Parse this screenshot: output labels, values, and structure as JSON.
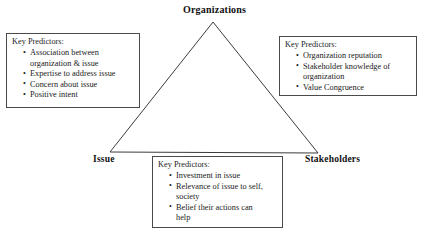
{
  "diagram": {
    "title_label": "Organizations",
    "vertices": [
      {
        "id": "organizations",
        "label": "Organizations"
      },
      {
        "id": "issue",
        "label": "Issue"
      },
      {
        "id": "stakeholders",
        "label": "Stakeholders"
      }
    ],
    "shape": {
      "type": "triangle",
      "stroke_color": "#3b3b3b",
      "apex": [
        213,
        22
      ],
      "bottom_left": [
        110,
        152
      ],
      "bottom_right": [
        318,
        153
      ]
    },
    "boxes": {
      "organizations": {
        "heading": "Key Predictors:",
        "items": [
          {
            "text": "Association between",
            "continuation": "organization & issue"
          },
          {
            "text": "Expertise to address issue",
            "continuation": ""
          },
          {
            "text": "Concern about issue",
            "continuation": ""
          },
          {
            "text": "Positive intent",
            "continuation": ""
          }
        ]
      },
      "stakeholders": {
        "heading": "Key Predictors:",
        "items": [
          {
            "text": "Organization reputation",
            "continuation": ""
          },
          {
            "text": "Stakeholder knowledge of",
            "continuation": "organization"
          },
          {
            "text": "Value Congruence",
            "continuation": ""
          }
        ]
      },
      "issue": {
        "heading": "Key Predictors:",
        "items": [
          {
            "text": "Investment in issue",
            "continuation": ""
          },
          {
            "text": "Relevance of issue to self,",
            "continuation": "society"
          },
          {
            "text": "Belief their actions can",
            "continuation": "help"
          }
        ]
      }
    }
  },
  "colors": {
    "background": "#ffffff",
    "text": "#111111",
    "box_border": "#4a4a4a",
    "triangle_stroke": "#3b3b3b"
  }
}
